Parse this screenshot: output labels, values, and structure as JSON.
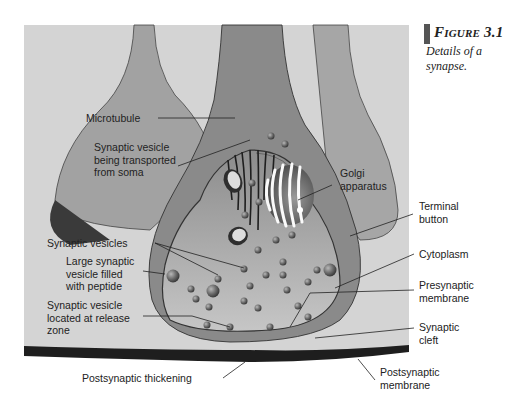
{
  "caption": {
    "title": "Figure 3.1",
    "subtitle": "Details of a synapse."
  },
  "labels": {
    "microtubule": "Microtubule",
    "vesicle_transported": "Synaptic vesicle\nbeing transported\nfrom soma",
    "golgi": "Golgi\napparatus",
    "terminal_button": "Terminal\nbutton",
    "synaptic_vesicles": "Synaptic vesicles",
    "cytoplasm": "Cytoplasm",
    "large_vesicle": "Large synaptic\nvesicle filled\nwith peptide",
    "presynaptic_membrane": "Presynaptic\nmembrane",
    "release_zone_vesicle": "Synaptic vesicle\nlocated at release\nzone",
    "synaptic_cleft": "Synaptic\ncleft",
    "postsynaptic_thickening": "Postsynaptic thickening",
    "postsynaptic_membrane": "Postsynaptic\nmembrane"
  },
  "colors": {
    "background": "#d4d4d4",
    "axon_fill": "#9a9a9a",
    "terminal_outer": "#808080",
    "terminal_inner": "#bdbdbd",
    "membrane_dark": "#3a3a3a",
    "vesicle": "#6e6e6e",
    "postsynaptic_band": "#1e1e1e"
  }
}
